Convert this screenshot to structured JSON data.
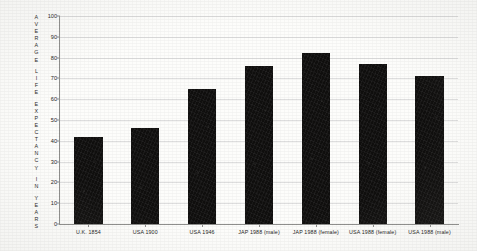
{
  "chart_data": {
    "type": "bar",
    "title": "",
    "xlabel": "",
    "ylabel": "AVERAGE LIFE EXPECTANCY IN YEARS",
    "ylabel_words": [
      "AVERAGE",
      "LIFE",
      "EXPECTANCY",
      "IN",
      "YEARS"
    ],
    "ylim": [
      0,
      100
    ],
    "ytick_labels": [
      "0",
      "10",
      "20",
      "30",
      "40",
      "50",
      "60",
      "70",
      "80",
      "90",
      "100"
    ],
    "ytick_values": [
      0,
      10,
      20,
      30,
      40,
      50,
      60,
      70,
      80,
      90,
      100
    ],
    "grid": true,
    "legend": "none",
    "bar_color": "#100f0e",
    "background_color": "#fdfdfb",
    "grid_color": "#dedede",
    "axis_color": "#8e8e8c",
    "categories": [
      "U.K. 1854",
      "USA 1900",
      "USA 1946",
      "JAP 1988 (male)",
      "JAP 1988 (female)",
      "USA 1988 (female)",
      "USA 1988 (male)"
    ],
    "values": [
      42,
      46,
      65,
      76,
      82,
      77,
      71
    ]
  }
}
